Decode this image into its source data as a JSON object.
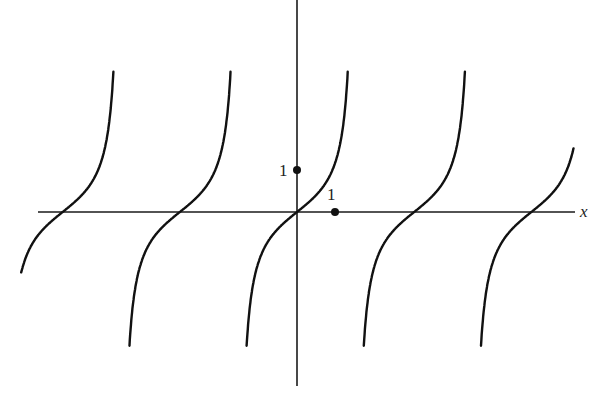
{
  "chart_data": {
    "type": "line",
    "title": "",
    "function": "y = tan(x)",
    "xlabel": "x",
    "ylabel": "",
    "grid": false,
    "legend": null,
    "annotations": [
      {
        "label": "1",
        "x": 0,
        "y": 1,
        "description": "marked point on y-axis"
      },
      {
        "label": "1",
        "x": 1,
        "y": 0,
        "description": "marked point on x-axis"
      }
    ],
    "xlim": [
      -7.1,
      7.3
    ],
    "ylim": [
      -4.0,
      3.5
    ],
    "zeros": [
      -6.283,
      -3.1416,
      0,
      3.1416,
      6.283
    ],
    "vertical_asymptotes": [
      -4.712,
      -1.5708,
      1.5708,
      4.712
    ],
    "series": [
      {
        "name": "branch-1",
        "x_range": [
          -7.0,
          -4.85
        ],
        "note": "partial branch, left edge"
      },
      {
        "name": "branch-2",
        "x_range": [
          -4.5,
          -1.7
        ]
      },
      {
        "name": "branch-3",
        "x_range": [
          -1.45,
          1.45
        ]
      },
      {
        "name": "branch-4",
        "x_range": [
          1.7,
          4.5
        ]
      },
      {
        "name": "branch-5",
        "x_range": [
          4.85,
          7.1
        ],
        "note": "partial branch, right edge"
      }
    ]
  },
  "labels": {
    "x_axis": "x",
    "y_tick_1": "1",
    "x_tick_1": "1"
  }
}
